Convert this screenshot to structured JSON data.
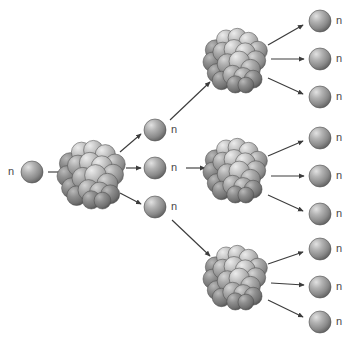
{
  "diagram": {
    "type": "nuclear-chain-reaction",
    "background_color": "#ffffff",
    "width": 345,
    "height": 339,
    "neutron_label": "n",
    "colors": {
      "background": "#ffffff",
      "arrow": "#3c3c3c",
      "label_text": "#4a4a4a",
      "sphere_light": "#d8d8d8",
      "sphere_mid": "#9a9a9a",
      "sphere_dark": "#5d5d5d",
      "sphere_outline": "#4f4f4f"
    },
    "generations": [
      {
        "index": 0,
        "name": "incident-neutron",
        "neutron_count": 1,
        "nucleus_count": 0
      },
      {
        "index": 1,
        "name": "first-fission",
        "neutron_count": 3,
        "nucleus_count": 1
      },
      {
        "index": 2,
        "name": "second-fission",
        "neutron_count": 9,
        "nucleus_count": 3
      }
    ],
    "totals": {
      "nuclei": 4,
      "neutrons": 13,
      "arrows": 13
    }
  },
  "neutrons": [
    {
      "id": "neutron-incident",
      "label": "n",
      "cx": 32,
      "cy": 172,
      "r": 11,
      "label_side": "left"
    },
    {
      "id": "neutron-g1-top",
      "label": "n",
      "cx": 155,
      "cy": 130,
      "r": 11,
      "label_side": "right"
    },
    {
      "id": "neutron-g1-middle",
      "label": "n",
      "cx": 155,
      "cy": 168,
      "r": 11,
      "label_side": "right"
    },
    {
      "id": "neutron-g1-bottom",
      "label": "n",
      "cx": 155,
      "cy": 207,
      "r": 11,
      "label_side": "right"
    },
    {
      "id": "neutron-g2-a1",
      "label": "n",
      "cx": 320,
      "cy": 21,
      "r": 11,
      "label_side": "right"
    },
    {
      "id": "neutron-g2-a2",
      "label": "n",
      "cx": 320,
      "cy": 59,
      "r": 11,
      "label_side": "right"
    },
    {
      "id": "neutron-g2-a3",
      "label": "n",
      "cx": 320,
      "cy": 97,
      "r": 11,
      "label_side": "right"
    },
    {
      "id": "neutron-g2-b1",
      "label": "n",
      "cx": 320,
      "cy": 138,
      "r": 11,
      "label_side": "right"
    },
    {
      "id": "neutron-g2-b2",
      "label": "n",
      "cx": 320,
      "cy": 176,
      "r": 11,
      "label_side": "right"
    },
    {
      "id": "neutron-g2-b3",
      "label": "n",
      "cx": 320,
      "cy": 214,
      "r": 11,
      "label_side": "right"
    },
    {
      "id": "neutron-g2-c1",
      "label": "n",
      "cx": 320,
      "cy": 249,
      "r": 11,
      "label_side": "right"
    },
    {
      "id": "neutron-g2-c2",
      "label": "n",
      "cx": 320,
      "cy": 287,
      "r": 11,
      "label_side": "right"
    },
    {
      "id": "neutron-g2-c3",
      "label": "n",
      "cx": 320,
      "cy": 322,
      "r": 11,
      "label_side": "right"
    }
  ],
  "nuclei": [
    {
      "id": "nucleus-center",
      "cx": 92,
      "cy": 174,
      "r": 35
    },
    {
      "id": "nucleus-top-right",
      "cx": 236,
      "cy": 60,
      "r": 33
    },
    {
      "id": "nucleus-mid-right",
      "cx": 236,
      "cy": 170,
      "r": 33
    },
    {
      "id": "nucleus-bot-right",
      "cx": 236,
      "cy": 277,
      "r": 33
    }
  ],
  "arrows": [
    {
      "id": "arrow-incident-to-center",
      "x1": 48,
      "y1": 172,
      "x2": 68,
      "y2": 172
    },
    {
      "id": "arrow-center-to-n1",
      "x1": 120,
      "y1": 152,
      "x2": 141,
      "y2": 134
    },
    {
      "id": "arrow-center-to-n2",
      "x1": 126,
      "y1": 168,
      "x2": 141,
      "y2": 168
    },
    {
      "id": "arrow-center-to-n3",
      "x1": 120,
      "y1": 193,
      "x2": 141,
      "y2": 204
    },
    {
      "id": "arrow-n1-to-nucleus-top",
      "x1": 170,
      "y1": 120,
      "x2": 210,
      "y2": 82
    },
    {
      "id": "arrow-n2-to-nucleus-mid",
      "x1": 186,
      "y1": 168,
      "x2": 205,
      "y2": 168
    },
    {
      "id": "arrow-n3-to-nucleus-bot",
      "x1": 172,
      "y1": 220,
      "x2": 210,
      "y2": 256
    },
    {
      "id": "arrow-nucleus-top-to-a1",
      "x1": 268,
      "y1": 45,
      "x2": 303,
      "y2": 25
    },
    {
      "id": "arrow-nucleus-top-to-a2",
      "x1": 271,
      "y1": 59,
      "x2": 304,
      "y2": 59
    },
    {
      "id": "arrow-nucleus-top-to-a3",
      "x1": 268,
      "y1": 78,
      "x2": 303,
      "y2": 94
    },
    {
      "id": "arrow-nucleus-mid-to-b1",
      "x1": 268,
      "y1": 156,
      "x2": 303,
      "y2": 141
    },
    {
      "id": "arrow-nucleus-mid-to-b2",
      "x1": 271,
      "y1": 176,
      "x2": 304,
      "y2": 176
    },
    {
      "id": "arrow-nucleus-mid-to-b3",
      "x1": 268,
      "y1": 195,
      "x2": 303,
      "y2": 211
    },
    {
      "id": "arrow-nucleus-bot-to-c1",
      "x1": 268,
      "y1": 264,
      "x2": 303,
      "y2": 252
    },
    {
      "id": "arrow-nucleus-bot-to-c2",
      "x1": 271,
      "y1": 283,
      "x2": 304,
      "y2": 285
    },
    {
      "id": "arrow-nucleus-bot-to-c3",
      "x1": 268,
      "y1": 300,
      "x2": 303,
      "y2": 317
    }
  ],
  "nucleon_layout": [
    {
      "dx": -0.62,
      "dy": -0.3,
      "r": 0.31,
      "shade": "dark"
    },
    {
      "dx": -0.3,
      "dy": -0.62,
      "r": 0.29,
      "shade": "light"
    },
    {
      "dx": 0.04,
      "dy": -0.68,
      "r": 0.28,
      "shade": "light"
    },
    {
      "dx": 0.38,
      "dy": -0.55,
      "r": 0.29,
      "shade": "light"
    },
    {
      "dx": 0.66,
      "dy": -0.28,
      "r": 0.29,
      "shade": "mid"
    },
    {
      "dx": -0.7,
      "dy": 0.06,
      "r": 0.3,
      "shade": "dark"
    },
    {
      "dx": -0.4,
      "dy": -0.24,
      "r": 0.3,
      "shade": "mid"
    },
    {
      "dx": -0.06,
      "dy": -0.32,
      "r": 0.3,
      "shade": "light"
    },
    {
      "dx": 0.28,
      "dy": -0.22,
      "r": 0.3,
      "shade": "light"
    },
    {
      "dx": 0.6,
      "dy": 0.02,
      "r": 0.3,
      "shade": "mid"
    },
    {
      "dx": -0.58,
      "dy": 0.4,
      "r": 0.29,
      "shade": "dark"
    },
    {
      "dx": -0.26,
      "dy": 0.12,
      "r": 0.31,
      "shade": "mid"
    },
    {
      "dx": 0.1,
      "dy": 0.04,
      "r": 0.31,
      "shade": "light"
    },
    {
      "dx": 0.44,
      "dy": 0.28,
      "r": 0.3,
      "shade": "mid"
    },
    {
      "dx": -0.44,
      "dy": 0.62,
      "r": 0.28,
      "shade": "dark"
    },
    {
      "dx": -0.1,
      "dy": 0.46,
      "r": 0.3,
      "shade": "mid"
    },
    {
      "dx": 0.22,
      "dy": 0.52,
      "r": 0.29,
      "shade": "mid"
    },
    {
      "dx": 0.52,
      "dy": 0.58,
      "r": 0.27,
      "shade": "dark"
    },
    {
      "dx": -0.02,
      "dy": 0.74,
      "r": 0.26,
      "shade": "dark"
    },
    {
      "dx": 0.3,
      "dy": 0.76,
      "r": 0.24,
      "shade": "dark"
    }
  ]
}
